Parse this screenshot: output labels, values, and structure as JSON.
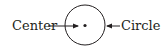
{
  "diagram": {
    "labels": {
      "center": "Center",
      "circle": "Circle"
    },
    "colors": {
      "stroke": "#231f20",
      "background": "#ffffff"
    },
    "shapes": {
      "circle": {
        "cx": 85,
        "cy": 25,
        "r": 20
      },
      "center_point": {
        "cx": 85,
        "cy": 25,
        "r": 1.6
      }
    }
  }
}
